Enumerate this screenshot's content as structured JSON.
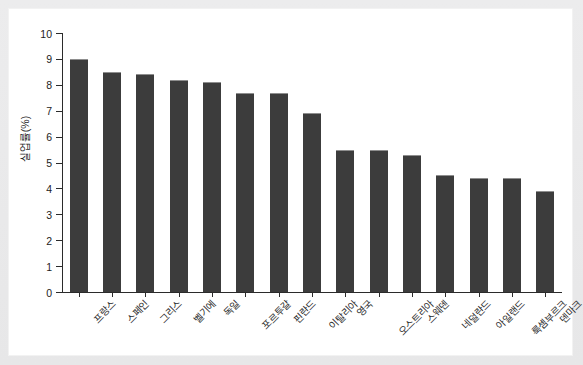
{
  "chart_data": {
    "type": "bar",
    "title": "",
    "xlabel": "",
    "ylabel": "실업률(%)",
    "ylim": [
      0,
      10
    ],
    "ytick_labels": [
      "0",
      "1",
      "2",
      "3",
      "4",
      "5",
      "6",
      "7",
      "8",
      "9",
      "10"
    ],
    "ytick_values": [
      0,
      1,
      2,
      3,
      4,
      5,
      6,
      7,
      8,
      9,
      10
    ],
    "grid": false,
    "legend": null,
    "bar_color": "#3c3c3c",
    "categories": [
      "프랑스",
      "스페인",
      "그리스",
      "벨기에",
      "독일",
      "포르투갈",
      "핀란드",
      "이탈리아",
      "영국",
      "오스트리아",
      "스웨덴",
      "네덜란드",
      "아일랜드",
      "룩셈부르크",
      "덴마크"
    ],
    "values": [
      9.0,
      8.5,
      8.4,
      8.2,
      8.1,
      7.7,
      7.7,
      6.9,
      5.5,
      5.5,
      5.3,
      4.5,
      4.4,
      4.4,
      3.9
    ]
  }
}
